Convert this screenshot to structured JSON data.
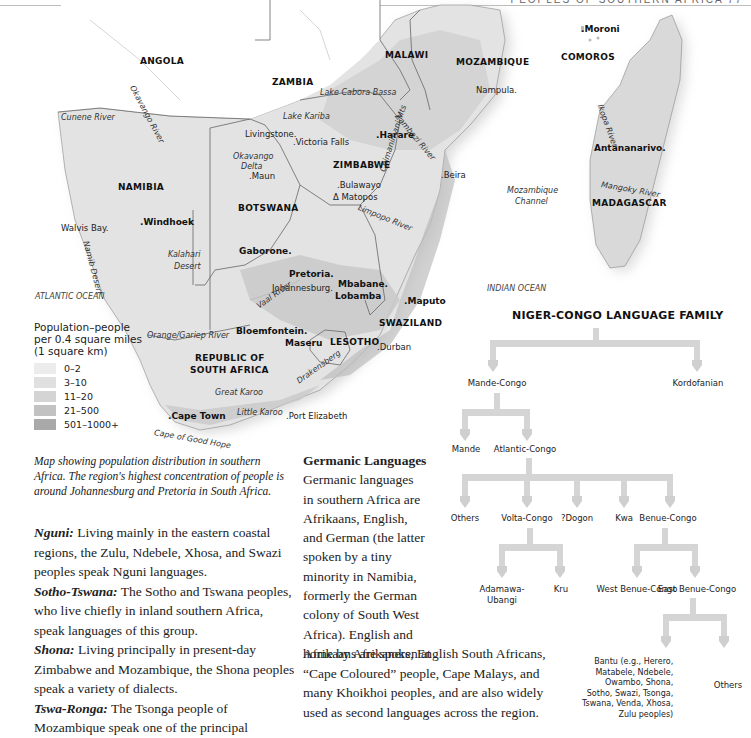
{
  "header": {
    "running_head": "PEOPLES OF SOUTHERN AFRICA 77"
  },
  "map": {
    "countries": [
      {
        "name": "ANGOLA",
        "x": 140,
        "y": 56
      },
      {
        "name": "ZAMBIA",
        "x": 272,
        "y": 77
      },
      {
        "name": "MALAWI",
        "x": 385,
        "y": 50
      },
      {
        "name": "MOZAMBIQUE",
        "x": 456,
        "y": 57
      },
      {
        "name": "COMOROS",
        "x": 561,
        "y": 52
      },
      {
        "name": "ZIMBABWE",
        "x": 333,
        "y": 160
      },
      {
        "name": "NAMIBIA",
        "x": 118,
        "y": 182
      },
      {
        "name": "BOTSWANA",
        "x": 238,
        "y": 203
      },
      {
        "name": "MADAGASCAR",
        "x": 592,
        "y": 198
      },
      {
        "name": "SWAZILAND",
        "x": 379,
        "y": 318
      },
      {
        "name": "LESOTHO",
        "x": 330,
        "y": 337
      },
      {
        "name": "REPUBLIC OF",
        "x": 195,
        "y": 353
      },
      {
        "name": "SOUTH AFRICA",
        "x": 190,
        "y": 365
      }
    ],
    "capitals": [
      {
        "name": ".Moroni",
        "x": 581,
        "y": 24
      },
      {
        "name": ".Harare",
        "x": 376,
        "y": 130
      },
      {
        "name": "Antananarivo.",
        "x": 594,
        "y": 143
      },
      {
        "name": ".Windhoek",
        "x": 140,
        "y": 217
      },
      {
        "name": "Gaborone.",
        "x": 239,
        "y": 246
      },
      {
        "name": "Pretoria.",
        "x": 289,
        "y": 269
      },
      {
        "name": ".Maputo",
        "x": 404,
        "y": 296
      },
      {
        "name": "Mbabane.",
        "x": 338,
        "y": 279
      },
      {
        "name": "Lobamba",
        "x": 335,
        "y": 291
      },
      {
        "name": "Bloemfontein.",
        "x": 236,
        "y": 326
      },
      {
        "name": "Maseru",
        "x": 285,
        "y": 338
      },
      {
        "name": ".Cape Town",
        "x": 168,
        "y": 411
      }
    ],
    "cities": [
      {
        "name": "Nampula.",
        "x": 476,
        "y": 85
      },
      {
        "name": "Livingstone.",
        "x": 245,
        "y": 129
      },
      {
        "name": ".Victoria Falls",
        "x": 293,
        "y": 137
      },
      {
        "name": ".Maun",
        "x": 249,
        "y": 171
      },
      {
        "name": ".Bulawayo",
        "x": 337,
        "y": 180
      },
      {
        "name": "Δ Matopos",
        "x": 333,
        "y": 192
      },
      {
        "name": ".Beira",
        "x": 441,
        "y": 170
      },
      {
        "name": "Walvis Bay.",
        "x": 61,
        "y": 223
      },
      {
        "name": "Johannesburg.",
        "x": 272,
        "y": 283
      },
      {
        "name": ".Durban",
        "x": 377,
        "y": 342
      },
      {
        "name": ".Port Elizabeth",
        "x": 286,
        "y": 411
      }
    ],
    "water": [
      {
        "name": "Lake Cabora Bassa",
        "x": 320,
        "y": 88
      },
      {
        "name": "Lake Kariba",
        "x": 283,
        "y": 112
      },
      {
        "name": "Cunene River",
        "x": 61,
        "y": 113
      },
      {
        "name": "Okavango River",
        "x": 136,
        "y": 84,
        "rotate": 62
      },
      {
        "name": "Okavango",
        "x": 233,
        "y": 152
      },
      {
        "name": "Delta",
        "x": 241,
        "y": 162
      },
      {
        "name": "Zambezi River",
        "x": 400,
        "y": 112,
        "rotate": 50
      },
      {
        "name": "Chimanimani Mts",
        "x": 378,
        "y": 170,
        "rotate": -72
      },
      {
        "name": "Limpopo River",
        "x": 360,
        "y": 203,
        "rotate": 22
      },
      {
        "name": "Ikopa River",
        "x": 604,
        "y": 103,
        "rotate": 70
      },
      {
        "name": "Mangoky River",
        "x": 602,
        "y": 180,
        "rotate": 10
      },
      {
        "name": "Mozambique",
        "x": 507,
        "y": 186
      },
      {
        "name": "Channel",
        "x": 515,
        "y": 197
      },
      {
        "name": "Namib Desert",
        "x": 90,
        "y": 240,
        "rotate": 75
      },
      {
        "name": "Kalahari",
        "x": 168,
        "y": 250
      },
      {
        "name": "Desert",
        "x": 174,
        "y": 262
      },
      {
        "name": "Vaal River",
        "x": 255,
        "y": 303,
        "rotate": -35
      },
      {
        "name": "Orange/Gariep River",
        "x": 147,
        "y": 331
      },
      {
        "name": "Great Karoo",
        "x": 215,
        "y": 388
      },
      {
        "name": "Little Karoo",
        "x": 237,
        "y": 408
      },
      {
        "name": "Drakensberg",
        "x": 295,
        "y": 378,
        "rotate": -35
      },
      {
        "name": "Cape of Good Hope",
        "x": 155,
        "y": 428,
        "rotate": 10
      }
    ],
    "oceans": [
      {
        "name": "ATLANTIC OCEAN",
        "x": 35,
        "y": 292
      },
      {
        "name": "INDIAN OCEAN",
        "x": 487,
        "y": 284
      }
    ]
  },
  "legend": {
    "title_lines": [
      "Population–people",
      "per 0.4 square miles",
      "(1 square km)"
    ],
    "items": [
      {
        "label": "0–2",
        "color": "#ececec"
      },
      {
        "label": "3–10",
        "color": "#e0e0e0"
      },
      {
        "label": "11–20",
        "color": "#d4d4d4"
      },
      {
        "label": "21–500",
        "color": "#c2c2c2"
      },
      {
        "label": "501–1000+",
        "color": "#a9a9a9"
      }
    ]
  },
  "caption": "Map showing population distribution in southern Africa. The region's highest concentration of people is around Johannesburg and Pretoria in South Africa.",
  "language_groups": [
    {
      "term": "Nguni:",
      "text": " Living mainly in the eastern coastal regions, the Zulu, Ndebele, Xhosa, and Swazi peoples speak Nguni languages."
    },
    {
      "term": "Sotho-Tswana:",
      "text": " The Sotho and Tswana peoples, who live chiefly in inland southern Africa, speak languages of this group."
    },
    {
      "term": "Shona:",
      "text": " Living principally in present-day Zimbabwe and Mozambique, the Shona peoples speak a variety of dialects."
    },
    {
      "term": "Tswa-Ronga:",
      "text": " The Tsonga people of Mozambique speak one of the principal"
    }
  ],
  "germanic": {
    "title": "Germanic Languages",
    "narrow_lines": [
      "Germanic languages",
      "in southern Africa are",
      "Afrikaans, English,",
      "and German (the latter",
      "spoken by a tiny",
      "minority in Namibia,",
      "formerly the German",
      "colony of South West",
      "Africa). English and",
      "Afrikaans are spoken at"
    ],
    "wide_lines": [
      "home by Afrikaners, English South Africans,",
      "“Cape Coloured” people, Cape Malays, and",
      "many Khoikhoi peoples, and are also widely",
      "used as second languages across the region."
    ]
  },
  "tree": {
    "title": "NIGER-CONGO LANGUAGE FAMILY",
    "nodes": {
      "mande_congo": "Mande-Congo",
      "kordofanian": "Kordofanian",
      "mande": "Mande",
      "atlantic_congo": "Atlantic-Congo",
      "others1": "Others",
      "volta_congo": "Volta-Congo",
      "dogon": "?Dogon",
      "kwa": "Kwa",
      "benue_congo": "Benue-Congo",
      "adamawa": "Adamawa-",
      "ubangi": "Ubangi",
      "kru": "Kru",
      "west_benue": "West Benue-Congo",
      "east_benue": "East Benue-Congo",
      "bantu_lines": [
        "Bantu (e.g., Herero,",
        "Matabele, Ndebele,",
        "Owambo, Shona,",
        "Sotho, Swazi, Tsonga,",
        "Tswana, Venda, Xhosa,",
        "Zulu peoples)"
      ],
      "others2": "Others"
    },
    "bar_color": "#d5d5d5"
  }
}
